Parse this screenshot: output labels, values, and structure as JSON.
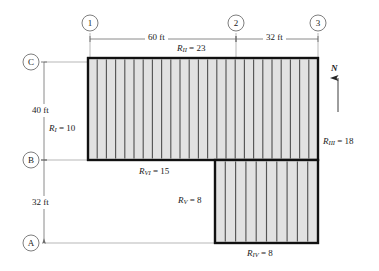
{
  "figure": {
    "colors": {
      "slab_fill": "#e2e2e2",
      "joist_line": "#4a4a4a",
      "outline": "#111111",
      "grid_line": "#8c8c8c",
      "text": "#1a1a1a"
    }
  },
  "grid_bubbles": {
    "columns": [
      {
        "label": "1",
        "x": 90
      },
      {
        "label": "2",
        "x": 236
      },
      {
        "label": "3",
        "x": 318
      }
    ],
    "rows": [
      {
        "label": "C",
        "y": 62
      },
      {
        "label": "B",
        "y": 160
      },
      {
        "label": "A",
        "y": 243
      }
    ]
  },
  "dimensions": {
    "horizontal": [
      {
        "name": "bay-1-2",
        "text": "60 ft"
      },
      {
        "name": "bay-2-3",
        "text": "32 ft"
      }
    ],
    "vertical": [
      {
        "name": "bay-C-B",
        "text": "40 ft"
      },
      {
        "name": "bay-B-A",
        "text": "32 ft"
      }
    ]
  },
  "reactions": [
    {
      "id": "R-I",
      "symbol": "R",
      "subscript": "I",
      "value": "10",
      "text": "R_I = 10"
    },
    {
      "id": "R-II",
      "symbol": "R",
      "subscript": "II",
      "value": "23",
      "text": "R_II = 23"
    },
    {
      "id": "R-III",
      "symbol": "R",
      "subscript": "III",
      "value": "18",
      "text": "R_III = 18"
    },
    {
      "id": "R-IV",
      "symbol": "R",
      "subscript": "IV",
      "value": "8",
      "text": "R_IV = 8"
    },
    {
      "id": "R-V",
      "symbol": "R",
      "subscript": "V",
      "value": "8",
      "text": "R_V = 8"
    },
    {
      "id": "R-VI",
      "symbol": "R",
      "subscript": "VI",
      "value": "15",
      "text": "R_VI = 15"
    }
  ],
  "north_arrow": {
    "label": "N"
  },
  "plan_geometry": {
    "upper_block": {
      "x": 88,
      "y": 58,
      "width": 230,
      "height": 102
    },
    "lower_block": {
      "x": 215,
      "y": 160,
      "width": 103,
      "height": 83
    },
    "upper_joist_count": 24,
    "lower_joist_count": 9
  },
  "equals_sign": "="
}
